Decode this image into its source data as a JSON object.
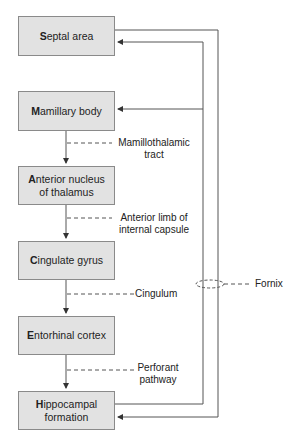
{
  "nodes": [
    {
      "id": "septal",
      "initial": "S",
      "rest": "eptal area",
      "line2": ""
    },
    {
      "id": "mamillary",
      "initial": "M",
      "rest": "amillary body",
      "line2": ""
    },
    {
      "id": "anterior",
      "initial": "A",
      "rest": "nterior nucleus",
      "line2": "of thalamus"
    },
    {
      "id": "cingulate",
      "initial": "C",
      "rest": "ingulate gyrus",
      "line2": ""
    },
    {
      "id": "entorhinal",
      "initial": "E",
      "rest": "ntorhinal cortex",
      "line2": ""
    },
    {
      "id": "hippocampal",
      "initial": "H",
      "rest": "ippocampal",
      "line2": "formation"
    }
  ],
  "labels": {
    "mamillothalamic_1": "Mamillothalamic",
    "mamillothalamic_2": "tract",
    "anterior_limb_1": "Anterior limb of",
    "anterior_limb_2": "internal capsule",
    "cingulum": "Cingulum",
    "perforant_1": "Perforant",
    "perforant_2": "pathway",
    "fornix": "Fornix"
  },
  "colors": {
    "box_fill": "#e2e2e2",
    "line": "#555555"
  }
}
